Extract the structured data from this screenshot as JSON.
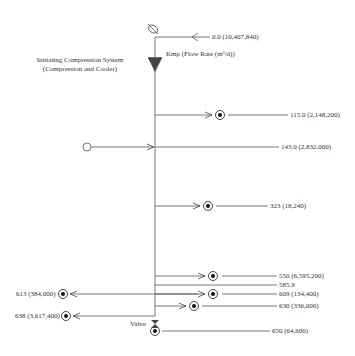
{
  "diagram": {
    "title": "Kmp (Flow Rate (m³/d))",
    "system_label_line1": "Initiating Compression System",
    "system_label_line2": "(Compression and Cooler)",
    "valve_label": "Valve",
    "top_inlet": {
      "label": "0.0 (10,407,840)",
      "kmp": 0.0,
      "flow": 10407840
    },
    "nodes": [
      {
        "label": "115.0 (2,148,200)",
        "kmp": 115.0,
        "flow": 2148200,
        "side": "right",
        "type": "well"
      },
      {
        "label": "143.0 (2,832,000)",
        "kmp": 143.0,
        "flow": 2832000,
        "side": "right",
        "type": "inlet-open"
      },
      {
        "label": "323 (18,240)",
        "kmp": 323,
        "flow": 18240,
        "side": "right",
        "type": "well"
      },
      {
        "label": "550 (6,595,200)",
        "kmp": 550,
        "flow": 6595200,
        "side": "right",
        "type": "well"
      },
      {
        "label": "585.9",
        "kmp": 585.9,
        "side": "right",
        "type": "junction"
      },
      {
        "label": "609 (134,400)",
        "kmp": 609,
        "flow": 134400,
        "side": "right",
        "type": "well"
      },
      {
        "label": "613 (384,000)",
        "kmp": 613,
        "flow": 384000,
        "side": "left",
        "type": "well"
      },
      {
        "label": "630 (336,000)",
        "kmp": 630,
        "flow": 336000,
        "side": "right",
        "type": "well"
      },
      {
        "label": "638 (3,617,400)",
        "kmp": 638,
        "flow": 3617400,
        "side": "left",
        "type": "well"
      },
      {
        "label": "650 (64,600)",
        "kmp": 650,
        "flow": 64600,
        "side": "right",
        "type": "well"
      }
    ]
  }
}
